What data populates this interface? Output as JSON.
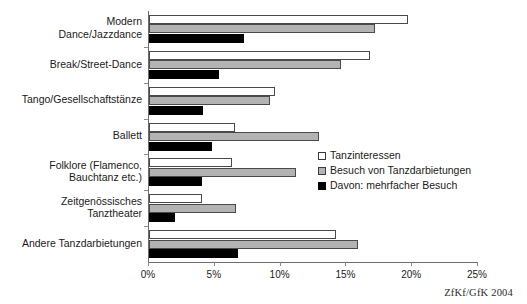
{
  "figure": {
    "top_cut_text": "",
    "credit": "ZfKf/GfK 2004"
  },
  "legend": {
    "position": "inside-right",
    "entries": [
      {
        "label": "Tanzinteressen",
        "swatch": "white-square",
        "color": "#ffffff"
      },
      {
        "label": "Besuch von Tanzdarbietungen",
        "swatch": "gray-square",
        "color": "#b3b3b3"
      },
      {
        "label": "Davon: mehrfacher Besuch",
        "swatch": "black-square",
        "color": "#000000"
      }
    ]
  },
  "axis": {
    "x_ticks": [
      "0%",
      "5%",
      "10%",
      "15%",
      "20%",
      "25%"
    ],
    "x_min": 0,
    "x_max": 25
  },
  "chart_data": {
    "type": "bar",
    "orientation": "horizontal",
    "title": "",
    "subtitle": "",
    "xlabel": "",
    "ylabel": "",
    "xlim": [
      0,
      25
    ],
    "xtick_values": [
      0,
      5,
      10,
      15,
      20,
      25
    ],
    "xtick_labels": [
      "0%",
      "5%",
      "10%",
      "15%",
      "20%",
      "25%"
    ],
    "grid": false,
    "legend_position": "inside-right",
    "units": "percent",
    "categories": [
      "Modern\nDance/Jazzdance",
      "Break/Street-Dance",
      "Tango/Gesellschaftstänze",
      "Ballett",
      "Folklore (Flamenco,\nBauchtanz etc.)",
      "Zeitgenössisches\nTanztheater",
      "Andere Tanzdarbietungen"
    ],
    "series": [
      {
        "name": "Tanzinteressen",
        "color": "#ffffff",
        "values": [
          19.7,
          16.8,
          9.6,
          6.5,
          6.3,
          4.0,
          14.2
        ]
      },
      {
        "name": "Besuch von Tanzdarbietungen",
        "color": "#b3b3b3",
        "values": [
          17.2,
          14.6,
          9.2,
          12.9,
          11.2,
          6.6,
          15.9
        ]
      },
      {
        "name": "Davon: mehrfacher Besuch",
        "color": "#000000",
        "values": [
          7.2,
          5.3,
          4.1,
          4.8,
          4.0,
          2.0,
          6.8
        ]
      }
    ]
  }
}
